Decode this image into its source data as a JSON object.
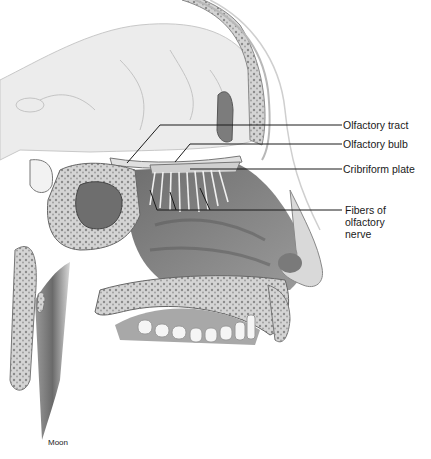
{
  "figure": {
    "labels": [
      {
        "id": "olfactory-tract",
        "text": "Olfactory tract",
        "x": 343,
        "y": 119
      },
      {
        "id": "olfactory-bulb",
        "text": "Olfactory bulb",
        "x": 343,
        "y": 138
      },
      {
        "id": "cribriform-plate",
        "text": "Cribriform plate",
        "x": 343,
        "y": 163
      }
    ],
    "fibers_label": {
      "id": "fibers-of-olfactory-nerve",
      "lines": [
        "Fibers of",
        "olfactory",
        "nerve"
      ],
      "x": 345,
      "y": 204
    },
    "credit": "Moon",
    "colors": {
      "line": "#1a1a1a",
      "tissue_light": "#e6e6e6",
      "tissue_mid": "#bdbdbd",
      "tissue_dark": "#7a7a7a",
      "bone": "#d0d0d0"
    }
  }
}
